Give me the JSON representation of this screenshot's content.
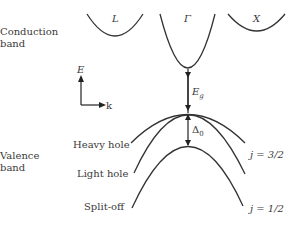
{
  "diagram": {
    "type": "band-structure",
    "colors": {
      "line": "#333333",
      "text": "#3a3a3a",
      "background": "#ffffff"
    },
    "labels": {
      "conduction_band_line1": "Conduction",
      "conduction_band_line2": "band",
      "valence_band_line1": "Valence",
      "valence_band_line2": "band",
      "heavy_hole": "Heavy hole",
      "light_hole": "Light hole",
      "split_off": "Split-off",
      "j_32": "j = 3/2",
      "j_12": "j = 1/2"
    },
    "valleys": [
      {
        "name": "L",
        "label": "L"
      },
      {
        "name": "Gamma",
        "label": "Γ"
      },
      {
        "name": "X",
        "label": "X"
      }
    ],
    "axes": {
      "y_label": "E",
      "x_label": "k"
    },
    "gaps": {
      "band_gap": {
        "symbol": "E",
        "subscript": "g"
      },
      "spin_orbit": {
        "symbol": "Δ",
        "subscript": "0"
      }
    }
  }
}
